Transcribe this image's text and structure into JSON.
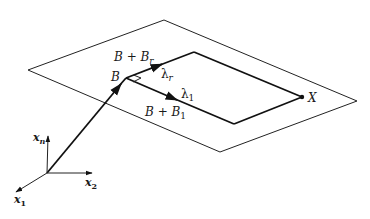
{
  "diagram": {
    "type": "geometric-vector-diagram",
    "labels": {
      "b_plus_br": {
        "base": "B + B",
        "sub": "r"
      },
      "b": "B",
      "lambda_r": {
        "base": "λ",
        "sub": "r"
      },
      "lambda_1": {
        "base": "λ",
        "sub": "1"
      },
      "b_plus_b1": {
        "base": "B + B",
        "sub": "1"
      },
      "x_point": "X",
      "axis_xn": {
        "base": "x",
        "sub": "n"
      },
      "axis_x2": {
        "base": "x",
        "sub": "2"
      },
      "axis_x1": {
        "base": "x",
        "sub": "1"
      }
    },
    "geometry": {
      "outer_plane": [
        [
          28,
          70
        ],
        [
          164,
          20
        ],
        [
          357,
          101
        ],
        [
          220,
          152
        ]
      ],
      "inner_parallelogram": {
        "B": [
          126,
          78
        ],
        "top": [
          194,
          52
        ],
        "X": [
          302,
          97
        ],
        "bottom": [
          234,
          124
        ]
      },
      "origin": [
        47,
        173
      ],
      "axis_xn_end": [
        48,
        135
      ],
      "axis_x2_end": [
        93,
        173
      ],
      "axis_x1_end": [
        15,
        193
      ]
    },
    "colors": {
      "stroke": "#111111",
      "background": "#ffffff"
    }
  }
}
